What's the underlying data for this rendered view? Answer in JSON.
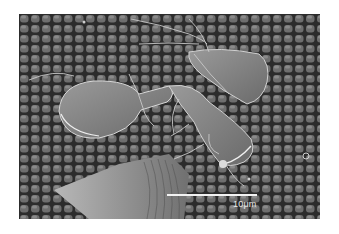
{
  "image": {
    "type": "scanning electron micrograph",
    "subject": "flagellated pear-shaped trophozoites on a cobblestone cell surface",
    "colors": {
      "background": "#ffffff",
      "surface_dark": "#2e2e2e",
      "cell_tile": "#6a6a6a",
      "organism": "#8a8a8a",
      "highlight": "#e6e6e6"
    }
  },
  "scale_bar": {
    "label": "10μm"
  }
}
